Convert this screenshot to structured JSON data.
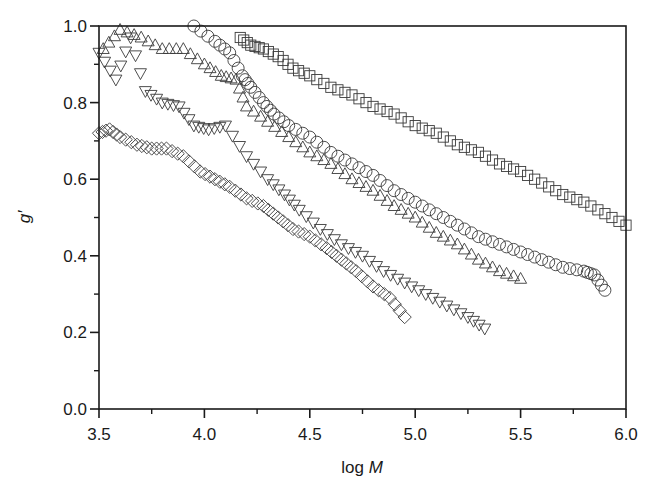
{
  "chart_data": {
    "type": "scatter",
    "title": "",
    "xlabel": "log M",
    "xlabel_parts": {
      "plain": "log ",
      "italic": "M"
    },
    "ylabel": "g′",
    "xlim": [
      3.5,
      6.0
    ],
    "ylim": [
      0.0,
      1.0
    ],
    "xticks": [
      "3.5",
      "4.0",
      "4.5",
      "5.0",
      "5.5",
      "6.0"
    ],
    "xtick_values": [
      3.5,
      4.0,
      4.5,
      5.0,
      5.5,
      6.0
    ],
    "yticks": [
      "0.0",
      "0.2",
      "0.4",
      "0.6",
      "0.8",
      "1.0"
    ],
    "ytick_values": [
      0.0,
      0.2,
      0.4,
      0.6,
      0.8,
      1.0
    ],
    "grid": false,
    "legend": null,
    "series": [
      {
        "name": "squares",
        "marker": "square",
        "x": [
          4.17,
          4.22,
          4.28,
          4.35,
          4.42,
          4.5,
          4.6,
          4.7,
          4.8,
          4.9,
          5.0,
          5.1,
          5.2,
          5.3,
          5.4,
          5.5,
          5.6,
          5.7,
          5.8,
          5.9,
          6.0
        ],
        "y": [
          0.97,
          0.95,
          0.94,
          0.92,
          0.89,
          0.87,
          0.84,
          0.82,
          0.79,
          0.77,
          0.74,
          0.72,
          0.69,
          0.67,
          0.64,
          0.62,
          0.59,
          0.56,
          0.54,
          0.51,
          0.48
        ]
      },
      {
        "name": "circles",
        "marker": "circle",
        "x": [
          3.95,
          4.05,
          4.12,
          4.18,
          4.22,
          4.28,
          4.33,
          4.4,
          4.5,
          4.6,
          4.7,
          4.8,
          4.9,
          5.0,
          5.1,
          5.2,
          5.3,
          5.4,
          5.5,
          5.6,
          5.7,
          5.8,
          5.85,
          5.9
        ],
        "y": [
          1.0,
          0.96,
          0.93,
          0.87,
          0.84,
          0.8,
          0.77,
          0.74,
          0.71,
          0.67,
          0.64,
          0.61,
          0.57,
          0.54,
          0.51,
          0.48,
          0.45,
          0.43,
          0.41,
          0.39,
          0.37,
          0.36,
          0.35,
          0.31
        ]
      },
      {
        "name": "up-triangles",
        "marker": "triangle-up",
        "x": [
          3.52,
          3.6,
          3.7,
          3.8,
          3.9,
          4.0,
          4.08,
          4.15,
          4.2,
          4.3,
          4.4,
          4.5,
          4.6,
          4.7,
          4.8,
          4.9,
          5.0,
          5.1,
          5.2,
          5.3,
          5.4,
          5.5
        ],
        "y": [
          0.94,
          0.99,
          0.97,
          0.94,
          0.94,
          0.9,
          0.87,
          0.86,
          0.79,
          0.75,
          0.71,
          0.67,
          0.64,
          0.6,
          0.57,
          0.53,
          0.5,
          0.46,
          0.43,
          0.39,
          0.36,
          0.34
        ]
      },
      {
        "name": "down-triangles",
        "marker": "triangle-down",
        "x": [
          3.5,
          3.58,
          3.65,
          3.72,
          3.8,
          3.88,
          3.95,
          4.02,
          4.1,
          4.2,
          4.3,
          4.38,
          4.45,
          4.55,
          4.65,
          4.75,
          4.85,
          4.95,
          5.05,
          5.15,
          5.25,
          5.33
        ],
        "y": [
          0.93,
          0.86,
          0.97,
          0.83,
          0.8,
          0.79,
          0.74,
          0.73,
          0.74,
          0.66,
          0.6,
          0.56,
          0.52,
          0.47,
          0.43,
          0.4,
          0.36,
          0.33,
          0.3,
          0.27,
          0.24,
          0.21
        ]
      },
      {
        "name": "diamonds",
        "marker": "diamond",
        "x": [
          3.5,
          3.55,
          3.6,
          3.68,
          3.75,
          3.82,
          3.9,
          3.98,
          4.05,
          4.12,
          4.2,
          4.28,
          4.35,
          4.42,
          4.5,
          4.58,
          4.65,
          4.72,
          4.8,
          4.88,
          4.95
        ],
        "y": [
          0.72,
          0.73,
          0.71,
          0.69,
          0.68,
          0.68,
          0.66,
          0.62,
          0.6,
          0.58,
          0.55,
          0.53,
          0.5,
          0.47,
          0.45,
          0.42,
          0.39,
          0.36,
          0.32,
          0.29,
          0.24
        ]
      }
    ]
  },
  "plot": {
    "left": 99,
    "right": 626,
    "top": 26,
    "bottom": 409,
    "marker_size": 6,
    "line_color": "#1a1a1a",
    "marker_color": "#3a3a3a",
    "points_per_segment": 3
  }
}
